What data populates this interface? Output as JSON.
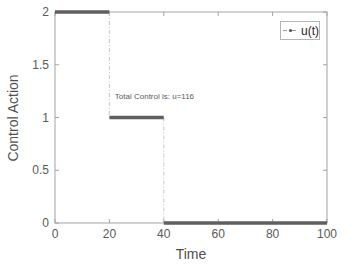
{
  "chart_data": {
    "type": "line",
    "subtype": "stairs",
    "title": "",
    "xlabel": "Time",
    "ylabel": "Control Action",
    "xlim": [
      0,
      100
    ],
    "ylim": [
      0,
      2
    ],
    "xticks": [
      "0",
      "20",
      "40",
      "60",
      "80",
      "100"
    ],
    "xtick_values": [
      0,
      20,
      40,
      60,
      80,
      100
    ],
    "yticks": [
      "0",
      "0.5",
      "1",
      "1.5",
      "2"
    ],
    "ytick_values": [
      0,
      0.5,
      1,
      1.5,
      2
    ],
    "grid": false,
    "legend_position": "top-right",
    "series": [
      {
        "name": "u(t)",
        "steps": [
          {
            "x_start": 0,
            "x_end": 20,
            "u": 2
          },
          {
            "x_start": 20,
            "x_end": 40,
            "u": 1
          },
          {
            "x_start": 40,
            "x_end": 100,
            "u": 0
          }
        ],
        "x": [
          0,
          20,
          40,
          100
        ],
        "y": [
          2,
          1,
          0,
          0
        ],
        "line_style": "dash-dot",
        "marker": "dot"
      }
    ],
    "annotation": {
      "text": "Total Control is: u=116",
      "x": 22,
      "y": 1.2
    },
    "legend": {
      "label": "u(t)"
    }
  },
  "colors": {
    "step_line": "#5f5f5f",
    "connector_line": "#c9c9c9",
    "axis": "#a3a3a3",
    "tick_label": "#595959",
    "axis_label": "#4f4f4f",
    "annotation_text": "#5a5a5a",
    "legend_border": "#b4b4b4",
    "legend_text": "#252525",
    "background": "#ffffff"
  }
}
